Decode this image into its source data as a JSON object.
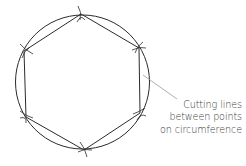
{
  "diagram": {
    "type": "geometric-construction",
    "circle": {
      "cx": 82.5,
      "cy": 82,
      "r": 66
    },
    "vertices": [
      {
        "x": 81,
        "y": 14
      },
      {
        "x": 139,
        "y": 48
      },
      {
        "x": 140,
        "y": 113
      },
      {
        "x": 84,
        "y": 150
      },
      {
        "x": 26,
        "y": 117
      },
      {
        "x": 24,
        "y": 51
      }
    ],
    "leader": {
      "x1": 143,
      "y1": 75,
      "x2": 177,
      "y2": 99
    },
    "colors": {
      "line": "#2b2b2b",
      "leader": "#9a9a9a",
      "text": "#3a3a3a"
    },
    "annotation": {
      "lines": [
        "Cutting lines",
        "between points",
        "on circumference"
      ]
    }
  }
}
